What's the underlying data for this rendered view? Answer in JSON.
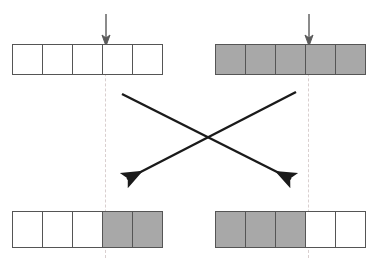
{
  "figure": {
    "type": "crossover-diagram",
    "title": "",
    "background_color": "#ffffff",
    "gray_fill": "#a8a8a8",
    "white_fill": "#ffffff",
    "cell_border_color": "#555555",
    "arrow_color": "#1a1a1a",
    "cutline_color": "#d9cfcf"
  },
  "parents": [
    {
      "id": "parent-1",
      "label": "",
      "cells": [
        "white",
        "white",
        "white",
        "white",
        "white"
      ],
      "cut_after_index": 3,
      "marker": "down-arrow"
    },
    {
      "id": "parent-2",
      "label": "",
      "cells": [
        "gray",
        "gray",
        "gray",
        "gray",
        "gray"
      ],
      "cut_after_index": 3,
      "marker": "down-arrow"
    }
  ],
  "offspring": [
    {
      "id": "child-1",
      "label": "",
      "cells": [
        "white",
        "white",
        "white",
        "gray",
        "gray"
      ],
      "cut_after_index": 3
    },
    {
      "id": "child-2",
      "label": "",
      "cells": [
        "gray",
        "gray",
        "gray",
        "white",
        "white"
      ],
      "cut_after_index": 3
    }
  ],
  "crossover_arrows": [
    {
      "id": "arrow-left-to-right",
      "from": "parent-1",
      "to": "child-2",
      "direction": "down-right"
    },
    {
      "id": "arrow-right-to-left",
      "from": "parent-2",
      "to": "child-1",
      "direction": "down-left"
    }
  ],
  "icons": {
    "cut_marker": "down-arrow-icon",
    "crossover": "crossing-arrows-icon"
  }
}
